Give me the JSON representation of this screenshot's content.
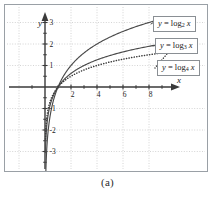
{
  "figure": {
    "caption": "(a)",
    "background_color": "#ffffff",
    "border_color": "#9aa0a6"
  },
  "axes": {
    "x_label": "x",
    "y_label": "y",
    "x_ticks": [
      2,
      4,
      6,
      8
    ],
    "y_ticks": [
      3,
      2,
      1,
      -1,
      -2,
      -3
    ],
    "x_tick_labels": [
      "2",
      "4",
      "6",
      "8"
    ],
    "y_tick_labels": [
      "3",
      "2",
      "1",
      "-1",
      "-2",
      "-3"
    ],
    "axis_color": "#3a3a3a",
    "grid_color": "#c9c9c9",
    "grid": "dotted"
  },
  "legend": {
    "items": [
      {
        "name": "log2",
        "text": "y = log2 x",
        "base": "2",
        "prefix": "y = log",
        "suffix": " x"
      },
      {
        "name": "log3",
        "text": "y = log3 x",
        "base": "3",
        "prefix": "y = log",
        "suffix": " x"
      },
      {
        "name": "log4",
        "text": "y = log4 x",
        "base": "4",
        "prefix": "y = log",
        "suffix": " x"
      }
    ]
  },
  "chart_data": {
    "type": "line",
    "title": "",
    "subtitle": "",
    "xlabel": "x",
    "ylabel": "y",
    "xlim": [
      -1.2,
      9.8
    ],
    "ylim": [
      -3.9,
      3.4
    ],
    "grid": true,
    "legend_position": "right-boxed-callouts",
    "annotations": [
      "(a)"
    ],
    "xticks": [
      2,
      4,
      6,
      8
    ],
    "yticks": [
      3,
      2,
      1,
      -1,
      -2,
      -3
    ],
    "series": [
      {
        "name": "y = log2 x",
        "base": 2,
        "style": "solid",
        "color": "#4a4a4a",
        "x": [
          0.08,
          0.12,
          0.18,
          0.25,
          0.35,
          0.5,
          0.7,
          1.0,
          1.5,
          2.0,
          2.5,
          3.0,
          3.5,
          4.0,
          5.0,
          6.0,
          7.0,
          8.0,
          8.6
        ],
        "y": [
          -3.64,
          -3.06,
          -2.47,
          -2.0,
          -1.51,
          -1.0,
          -0.51,
          0.0,
          0.58,
          1.0,
          1.32,
          1.58,
          1.81,
          2.0,
          2.32,
          2.58,
          2.81,
          3.0,
          3.1
        ]
      },
      {
        "name": "y = log3 x",
        "base": 3,
        "style": "solid",
        "color": "#4a4a4a",
        "x": [
          0.05,
          0.08,
          0.12,
          0.2,
          0.33,
          0.5,
          0.7,
          1.0,
          1.5,
          2.0,
          3.0,
          4.0,
          5.0,
          6.0,
          7.0,
          8.0,
          9.0,
          9.4
        ],
        "y": [
          -2.73,
          -2.3,
          -1.93,
          -1.46,
          -1.0,
          -0.63,
          -0.32,
          0.0,
          0.37,
          0.63,
          1.0,
          1.26,
          1.46,
          1.63,
          1.77,
          1.89,
          2.0,
          2.04
        ]
      },
      {
        "name": "y = log4 x",
        "base": 4,
        "style": "dotted",
        "color": "#3a3a3a",
        "x": [
          0.04,
          0.06,
          0.1,
          0.16,
          0.25,
          0.4,
          0.6,
          1.0,
          1.5,
          2.0,
          3.0,
          4.0,
          5.0,
          6.0,
          7.0,
          8.0,
          9.0,
          9.5
        ],
        "y": [
          -2.32,
          -2.03,
          -1.66,
          -1.32,
          -1.0,
          -0.66,
          -0.37,
          0.0,
          0.29,
          0.5,
          0.79,
          1.0,
          1.16,
          1.29,
          1.4,
          1.5,
          1.58,
          1.62
        ]
      }
    ]
  }
}
